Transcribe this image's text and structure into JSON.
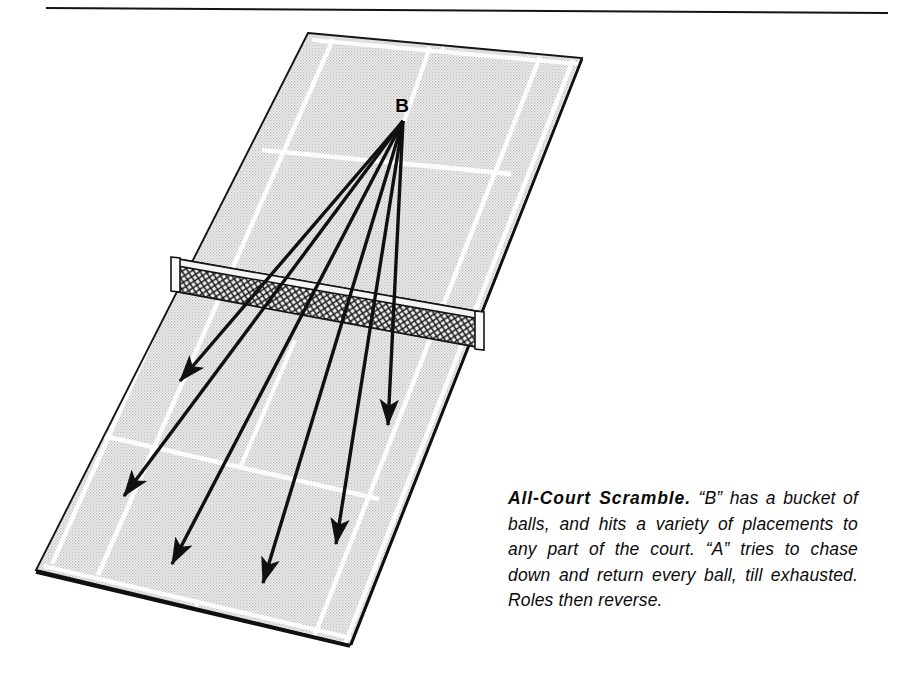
{
  "page": {
    "width": 910,
    "height": 700,
    "background_color": "#ffffff",
    "top_rule": {
      "name": "horizontal-rule",
      "x1": 46,
      "y1": 8,
      "x2": 888,
      "y2": 13,
      "color": "#141414"
    }
  },
  "diagram": {
    "player_labels": [
      {
        "id": "B",
        "label": "B",
        "x": 402,
        "y": 112
      }
    ],
    "court": {
      "name": "tennis-court",
      "fill_color": "#e9e9e9",
      "line_color": "#ffffff",
      "border_color": "#151515",
      "corners": {
        "far_left": {
          "x": 308,
          "y": 33
        },
        "far_right": {
          "x": 582,
          "y": 58
        },
        "near_right": {
          "x": 350,
          "y": 645
        },
        "near_left": {
          "x": 36,
          "y": 570
        }
      }
    },
    "net": {
      "name": "tennis-net",
      "mesh_color": "#1a1a1a",
      "post_color": "#ffffff",
      "left_post": {
        "x": 176,
        "y": 272
      },
      "right_post": {
        "x": 479,
        "y": 329
      }
    },
    "shot_arrows": {
      "name": "shot-trajectory-arrows",
      "origin": {
        "x": 403,
        "y": 121
      },
      "color": "#101010",
      "count": 6,
      "endpoints": [
        {
          "id": "shot-1",
          "x": 180,
          "y": 381
        },
        {
          "id": "shot-2",
          "x": 124,
          "y": 496
        },
        {
          "id": "shot-3",
          "x": 172,
          "y": 564
        },
        {
          "id": "shot-4",
          "x": 263,
          "y": 583
        },
        {
          "id": "shot-5",
          "x": 336,
          "y": 544
        },
        {
          "id": "shot-6",
          "x": 388,
          "y": 425
        }
      ]
    }
  },
  "caption": {
    "name": "drill-caption",
    "title": "All-Court Scramble.",
    "body": " “B” has a bucket of balls, and hits a variety of placements to any part of the court. “A” tries to chase down and return every ball, till exhausted. Roles then reverse."
  }
}
